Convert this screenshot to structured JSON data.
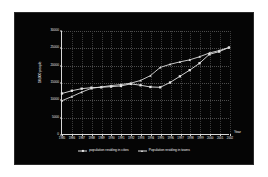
{
  "chart_data": {
    "type": "line",
    "title": "",
    "xlabel": "Year",
    "ylabel": "10,000 people",
    "ylim": [
      0,
      30000
    ],
    "yticks": [
      0,
      5000,
      10000,
      15000,
      20000,
      25000,
      30000
    ],
    "ytick_labels": [
      "0",
      "5000",
      "10000",
      "15000",
      "20000",
      "25000",
      "30000"
    ],
    "grid": true,
    "legend_position": "bottom",
    "categories": [
      "1985",
      "1986",
      "1987",
      "1988",
      "1989",
      "1990",
      "1991",
      "1992",
      "1993",
      "1994",
      "1995",
      "1996",
      "1997",
      "1998",
      "1999",
      "2000",
      "2001",
      "2002"
    ],
    "series": [
      {
        "name": "population residing in cities",
        "marker": "square",
        "color": "#e6e6e6",
        "values": [
          11800,
          12600,
          13200,
          13500,
          13600,
          13800,
          14000,
          14600,
          14200,
          13700,
          13600,
          15000,
          16800,
          18600,
          20600,
          23200,
          24000,
          25200
        ]
      },
      {
        "name": "Population residing in towns",
        "marker": "triangle",
        "color": "#dcdcdc",
        "values": [
          9700,
          10900,
          12200,
          13300,
          13700,
          14100,
          14400,
          14800,
          15600,
          17000,
          19400,
          20300,
          21000,
          21600,
          22500,
          23600,
          24300,
          25200
        ]
      }
    ]
  },
  "legend": {
    "items": [
      {
        "label": "population residing in cities"
      },
      {
        "label": "Population residing in towns"
      }
    ]
  },
  "axes": {
    "y_axis_title": "10,000 people",
    "x_axis_title": "Year"
  }
}
